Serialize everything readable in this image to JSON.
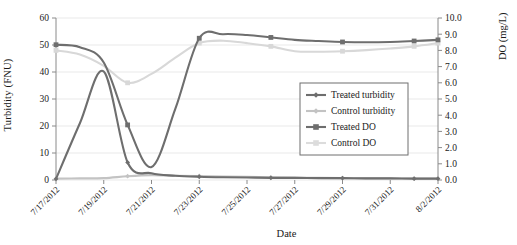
{
  "chart_data": {
    "type": "line",
    "title": "",
    "xlabel": "Date",
    "ylabel": "Turbidity (FNU)",
    "y2label": "DO (mg/L)",
    "ylim": [
      0,
      60
    ],
    "y2lim": [
      0.0,
      10.0
    ],
    "grid": true,
    "legend_position": "center-right-inside",
    "x": [
      "7/17/2012",
      "7/18/2012",
      "7/19/2012",
      "7/20/2012",
      "7/21/2012",
      "7/22/2012",
      "7/23/2012",
      "7/24/2012",
      "7/25/2012",
      "7/26/2012",
      "7/27/2012",
      "7/28/2012",
      "7/29/2012",
      "7/30/2012",
      "7/31/2012",
      "8/1/2012",
      "8/2/2012"
    ],
    "xtick_labels": [
      "7/17/2012",
      "7/19/2012",
      "7/21/2012",
      "7/23/2012",
      "7/25/2012",
      "7/27/2012",
      "7/29/2012",
      "7/31/2012",
      "8/2/2012"
    ],
    "ytick_labels": [
      "0",
      "10",
      "20",
      "30",
      "40",
      "50",
      "60"
    ],
    "y2tick_labels": [
      "0.0",
      "1.0",
      "2.0",
      "3.0",
      "4.0",
      "5.0",
      "6.0",
      "7.0",
      "8.0",
      "9.0",
      "10.0"
    ],
    "series": [
      {
        "name": "Treated turbidity",
        "axis": "left",
        "color": "#6e6e6e",
        "marker": "diamond",
        "values": [
          0.4,
          21.0,
          40.2,
          6.5,
          2.5,
          1.6,
          1.2,
          1.0,
          0.9,
          0.8,
          0.8,
          0.7,
          0.7,
          0.6,
          0.6,
          0.5,
          0.5
        ]
      },
      {
        "name": "Control turbidity",
        "axis": "left",
        "color": "#c3c3c3",
        "marker": "diamond",
        "values": [
          0.5,
          0.6,
          0.7,
          1.4,
          1.8,
          1.6,
          1.5,
          1.3,
          1.2,
          1.0,
          0.9,
          0.8,
          0.7,
          0.6,
          0.6,
          0.5,
          0.5
        ]
      },
      {
        "name": "Treated DO",
        "axis": "right",
        "color": "#6e6e6e",
        "marker": "square",
        "values": [
          8.35,
          8.2,
          7.25,
          3.4,
          0.8,
          4.4,
          8.75,
          9.0,
          8.95,
          8.8,
          8.65,
          8.58,
          8.52,
          8.5,
          8.52,
          8.58,
          8.65
        ]
      },
      {
        "name": "Control DO",
        "axis": "right",
        "color": "#d8d8d8",
        "marker": "square",
        "values": [
          8.0,
          7.75,
          7.05,
          6.0,
          6.55,
          7.55,
          8.45,
          8.6,
          8.45,
          8.25,
          7.95,
          7.92,
          7.95,
          8.02,
          8.12,
          8.25,
          8.45
        ]
      }
    ]
  },
  "legend": {
    "items": [
      {
        "label": "Treated turbidity",
        "color": "#6e6e6e",
        "marker": "diamond"
      },
      {
        "label": "Control turbidity",
        "color": "#c3c3c3",
        "marker": "diamond"
      },
      {
        "label": "Treated DO",
        "color": "#6e6e6e",
        "marker": "square"
      },
      {
        "label": "Control DO",
        "color": "#dcdcdc",
        "marker": "square"
      }
    ]
  },
  "axes": {
    "left_title": "Turbidity (FNU)",
    "right_title": "DO (mg/L)",
    "bottom_title": "Date"
  }
}
